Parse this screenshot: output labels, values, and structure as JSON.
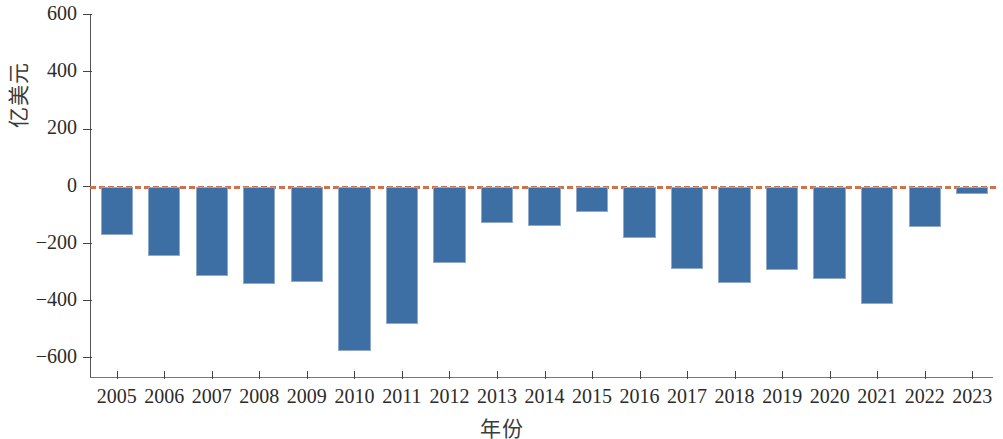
{
  "chart_data": {
    "type": "bar",
    "title": "",
    "subtitle": "",
    "xlabel": "年份",
    "ylabel": "亿美元",
    "categories": [
      "2005",
      "2006",
      "2007",
      "2008",
      "2009",
      "2010",
      "2011",
      "2012",
      "2013",
      "2014",
      "2015",
      "2016",
      "2017",
      "2018",
      "2019",
      "2020",
      "2021",
      "2022",
      "2023"
    ],
    "values": [
      -170,
      -243,
      -313,
      -340,
      -333,
      -575,
      -480,
      -268,
      -128,
      -139,
      -89,
      -181,
      -288,
      -337,
      -291,
      -323,
      -412,
      -142,
      -25
    ],
    "series": [
      {
        "name": "亿美元",
        "values": [
          -170,
          -243,
          -313,
          -340,
          -333,
          -575,
          -480,
          -268,
          -128,
          -139,
          -89,
          -181,
          -288,
          -337,
          -291,
          -323,
          -412,
          -142,
          -25
        ]
      }
    ],
    "ylim": [
      -700,
      600
    ],
    "ytick_values": [
      600,
      400,
      200,
      0,
      -200,
      -400,
      -600
    ],
    "ytick_labels": [
      "600",
      "400",
      "200",
      "0",
      "−200",
      "−400",
      "−600"
    ],
    "grid": false,
    "legend": false,
    "legend_position": "none",
    "bar_color": "#3d6fa4",
    "bar_edge_color": "#8fa9c6",
    "zero_line_color": "#d0714b",
    "zero_line_style": "dashed",
    "axis_color": "#444444",
    "annotations": []
  },
  "axes": {
    "y_label_text": "亿美元",
    "x_label_text": "年份"
  }
}
